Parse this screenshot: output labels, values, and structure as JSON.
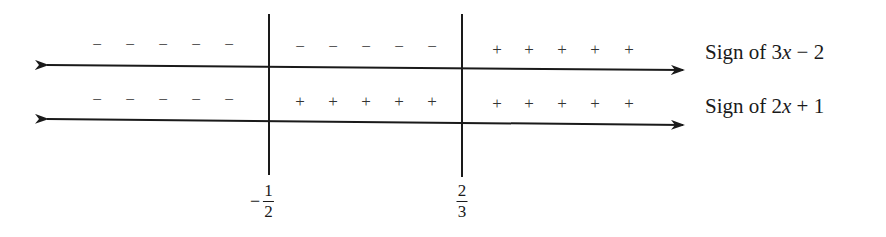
{
  "diagram": {
    "type": "sign-chart",
    "critical_points": [
      {
        "sign": "-",
        "numerator": "1",
        "denominator": "2",
        "x": 269
      },
      {
        "sign": "",
        "numerator": "2",
        "denominator": "3",
        "x": 462
      }
    ],
    "rows": [
      {
        "label_prefix": "Sign of ",
        "label_coef": "3",
        "label_var": "x",
        "label_rest": " − 2",
        "intervals": [
          {
            "symbol": "−",
            "count": 5
          },
          {
            "symbol": "−",
            "count": 5
          },
          {
            "symbol": "+",
            "count": 5
          }
        ]
      },
      {
        "label_prefix": "Sign of ",
        "label_coef": "2",
        "label_var": "x",
        "label_rest": " + 1",
        "intervals": [
          {
            "symbol": "−",
            "count": 5
          },
          {
            "symbol": "+",
            "count": 5
          },
          {
            "symbol": "+",
            "count": 5
          }
        ]
      }
    ],
    "colors": {
      "line": "#1a1a1a",
      "text": "#1a1a1a"
    }
  }
}
